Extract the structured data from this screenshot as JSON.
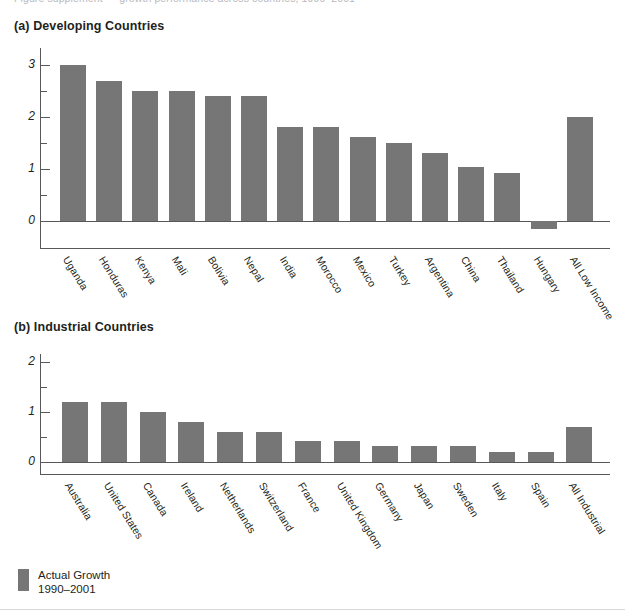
{
  "figure": {
    "cut_caption": "Figure supplement — growth performance across countries, 1990–2001",
    "legend": {
      "swatch_name": "actual-growth-swatch",
      "line1": "Actual Growth",
      "line2": "1990–2001",
      "color": "#767676"
    }
  },
  "panel_a": {
    "title": "(a) Developing Countries"
  },
  "panel_b": {
    "title": "(b) Industrial Countries"
  },
  "chart_data": [
    {
      "type": "bar",
      "id": "developing-countries",
      "title": "(a) Developing Countries",
      "xlabel": "",
      "ylabel": "",
      "ylim": [
        -0.5,
        3.25
      ],
      "yticks": [
        0,
        1,
        2,
        3
      ],
      "ytick_labels": [
        "0",
        "1",
        "2",
        "3"
      ],
      "yminor_ticks": [
        0.5,
        1.5,
        2.5
      ],
      "grid": false,
      "legend_position": "below-figure",
      "series_name": "Actual Growth 1990–2001",
      "color": "#767676",
      "categories": [
        "Uganda",
        "Honduras",
        "Kenya",
        "Mali",
        "Bolivia",
        "Nepal",
        "India",
        "Morocco",
        "Mexico",
        "Turkey",
        "Argentina",
        "China",
        "Thailand",
        "Hungary",
        "All Low Income"
      ],
      "values": [
        3.0,
        2.7,
        2.5,
        2.5,
        2.4,
        2.4,
        1.8,
        1.8,
        1.62,
        1.5,
        1.3,
        1.03,
        0.92,
        -0.15,
        2.0
      ]
    },
    {
      "type": "bar",
      "id": "industrial-countries",
      "title": "(b) Industrial Countries",
      "xlabel": "",
      "ylabel": "",
      "ylim": [
        0,
        2.2
      ],
      "yticks": [
        0,
        1,
        2
      ],
      "ytick_labels": [
        "0",
        "1",
        "2"
      ],
      "yminor_ticks": [
        0.5,
        1.5
      ],
      "grid": false,
      "legend_position": "below-figure",
      "series_name": "Actual Growth 1990–2001",
      "color": "#767676",
      "categories": [
        "Australia",
        "United States",
        "Canada",
        "Ireland",
        "Netherlands",
        "Switzerland",
        "France",
        "United Kingdom",
        "Germany",
        "Japan",
        "Sweden",
        "Italy",
        "Spain",
        "All Industrial"
      ],
      "values": [
        1.2,
        1.2,
        1.0,
        0.8,
        0.6,
        0.6,
        0.42,
        0.42,
        0.32,
        0.32,
        0.32,
        0.2,
        0.2,
        0.7
      ]
    }
  ]
}
